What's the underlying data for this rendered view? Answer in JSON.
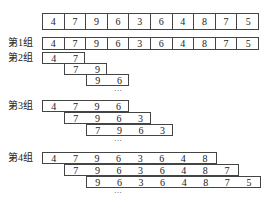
{
  "source_array": [
    "4",
    "7",
    "9",
    "6",
    "3",
    "6",
    "4",
    "8",
    "7",
    "5"
  ],
  "groups": [
    {
      "label": "第1组",
      "rows": [
        [
          "4",
          "7",
          "9",
          "6",
          "3",
          "6",
          "4",
          "8",
          "7",
          "5"
        ]
      ],
      "ellipsis": ""
    },
    {
      "label": "第2组",
      "rows": [
        [
          "4",
          "7"
        ],
        [
          "7",
          "9"
        ],
        [
          "9",
          "6"
        ]
      ],
      "ellipsis": "···"
    },
    {
      "label": "第3组",
      "rows": [
        [
          "4",
          "7",
          "9",
          "6"
        ],
        [
          "7",
          "9",
          "6",
          "3"
        ],
        [
          "7",
          "9",
          "6",
          "3"
        ]
      ],
      "ellipsis": "···"
    },
    {
      "label": "第4组",
      "rows": [
        [
          "4",
          "7",
          "9",
          "6",
          "3",
          "6",
          "4",
          "8"
        ],
        [
          "7",
          "9",
          "6",
          "3",
          "6",
          "4",
          "8",
          "7"
        ],
        [
          "9",
          "6",
          "3",
          "6",
          "4",
          "8",
          "7",
          "5"
        ]
      ],
      "ellipsis": "···"
    }
  ]
}
